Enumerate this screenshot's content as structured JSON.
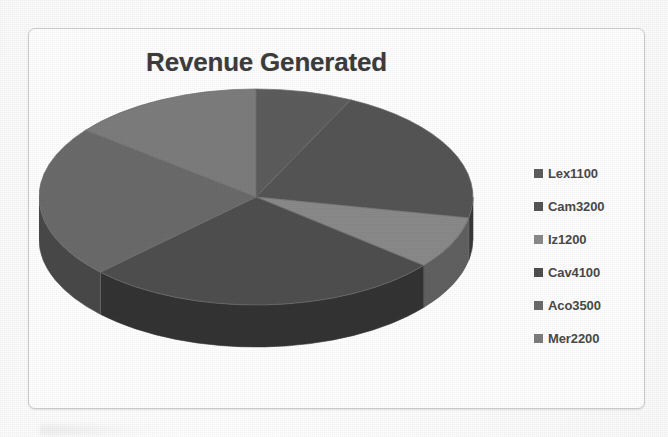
{
  "card": {
    "title": "Revenue Generated"
  },
  "legend": {
    "items": [
      {
        "label": "Lex1100",
        "swatch": "#5d5d5d"
      },
      {
        "label": "Cam3200",
        "swatch": "#555555"
      },
      {
        "label": "Iz1200",
        "swatch": "#8a8a8a"
      },
      {
        "label": "Cav4100",
        "swatch": "#4f4f4f"
      },
      {
        "label": "Aco3500",
        "swatch": "#6b6b6b"
      },
      {
        "label": "Mer2200",
        "swatch": "#7d7d7d"
      }
    ]
  },
  "chart_data": {
    "type": "pie",
    "title": "Revenue Generated",
    "subtitle": "",
    "xlabel": "",
    "ylabel": "",
    "three_d": true,
    "start_angle_deg": 0,
    "direction": "clockwise",
    "legend_position": "right",
    "grid": false,
    "total": 15300,
    "categories": [
      "Lex",
      "Cam",
      "Iz",
      "Cav",
      "Aco",
      "Mer"
    ],
    "labels": [
      "Lex1100",
      "Cam3200",
      "Iz1200",
      "Cav4100",
      "Aco3500",
      "Mer2200"
    ],
    "values": [
      1100,
      3200,
      1200,
      4100,
      3500,
      2200
    ],
    "percentages": [
      7.2,
      20.9,
      7.8,
      26.8,
      22.9,
      14.4
    ],
    "colors": [
      "#5d5d5d",
      "#555555",
      "#8a8a8a",
      "#4f4f4f",
      "#6b6b6b",
      "#7d7d7d"
    ],
    "side_colors": [
      "#3e3e3e",
      "#383838",
      "#616161",
      "#343434",
      "#494949",
      "#565656"
    ]
  }
}
